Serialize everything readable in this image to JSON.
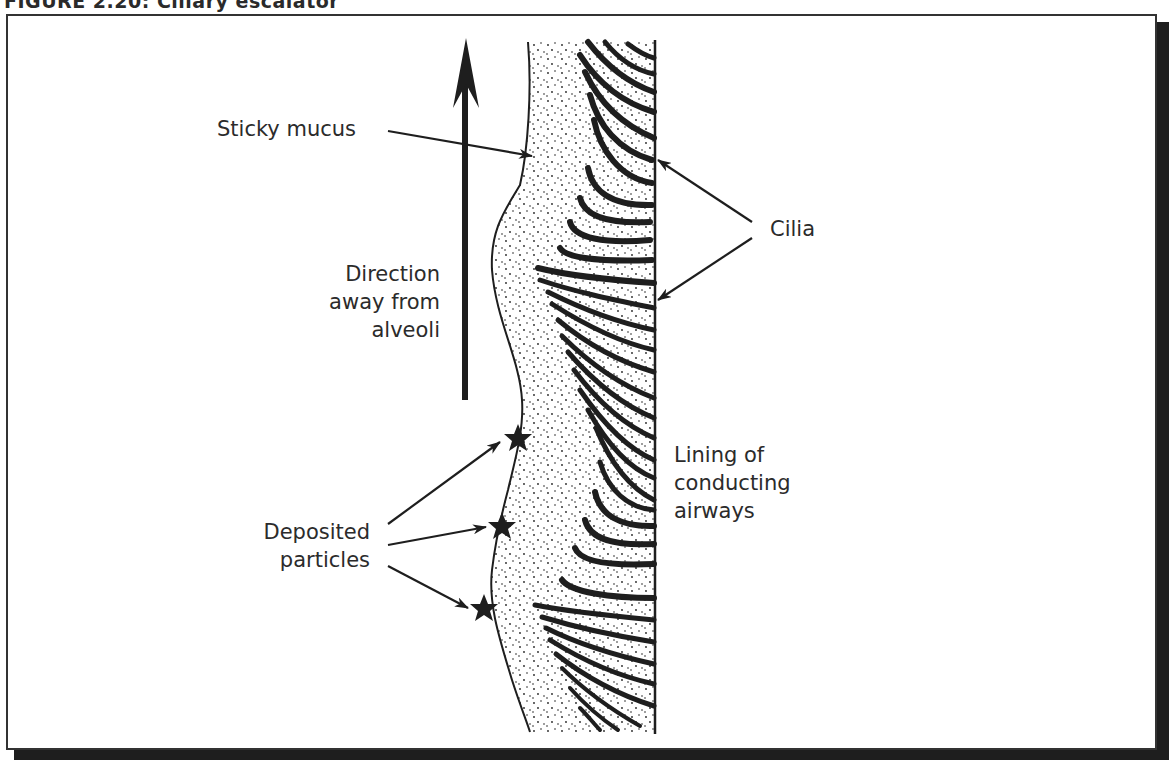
{
  "figure": {
    "title": "FIGURE 2.20: Ciliary escalator",
    "labels": {
      "sticky_mucus": "Sticky mucus",
      "direction_line1": "Direction",
      "direction_line2": "away from",
      "direction_line3": "alveoli",
      "cilia": "Cilia",
      "lining_line1": "Lining of",
      "lining_line2": "conducting",
      "lining_line3": "airways",
      "deposited_line1": "Deposited",
      "deposited_line2": "particles"
    },
    "elements": {
      "direction_arrow": "upward arrow indicating mucus flow away from alveoli",
      "mucus_layer": "stippled sticky mucus layer",
      "cilia": "curved cilia strokes attached to airway lining",
      "particles": [
        "star particle 1",
        "star particle 2",
        "star particle 3"
      ]
    },
    "colors": {
      "ink": "#1e1e1e",
      "text": "#2b2b2b",
      "background": "#ffffff"
    }
  }
}
